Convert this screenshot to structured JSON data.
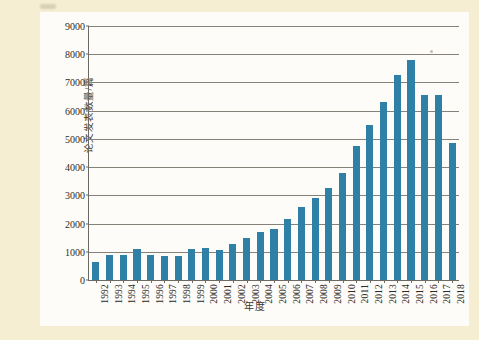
{
  "figure": {
    "background_color": "#fdfcf8",
    "page_background_color": "#f6eed3",
    "bar_color": "#2f80a6",
    "axis_color": "#6d6a64",
    "gridline_color": "#868279"
  },
  "chart_data": {
    "type": "bar",
    "title": "",
    "xlabel": "年度",
    "ylabel": "论文发表数量/篇",
    "ylim": [
      0,
      9000
    ],
    "grid": true,
    "legend": "none",
    "ytick_labels": [
      "0",
      "1000",
      "2000",
      "3000",
      "4000",
      "5000",
      "6000",
      "7000",
      "8000",
      "9000"
    ],
    "ytick_values": [
      0,
      1000,
      2000,
      3000,
      4000,
      5000,
      6000,
      7000,
      8000,
      9000
    ],
    "categories": [
      "1992",
      "1993",
      "1994",
      "1995",
      "1996",
      "1997",
      "1998",
      "1999",
      "2000",
      "2001",
      "2002",
      "2003",
      "2004",
      "2005",
      "2006",
      "2007",
      "2008",
      "2009",
      "2010",
      "2011",
      "2012",
      "2013",
      "2014",
      "2015",
      "2016",
      "2017",
      "2018"
    ],
    "values": [
      650,
      900,
      900,
      1100,
      870,
      850,
      850,
      1100,
      1150,
      1050,
      1280,
      1500,
      1700,
      1800,
      2150,
      2600,
      2900,
      3250,
      3800,
      4750,
      5500,
      6300,
      7250,
      7800,
      6550,
      6550,
      4850
    ],
    "values_tail_note": "",
    "series_name": "论文发表数量"
  },
  "annotations": {
    "speck_top": "scan-artifact",
    "speck_chart": "scan-artifact"
  }
}
